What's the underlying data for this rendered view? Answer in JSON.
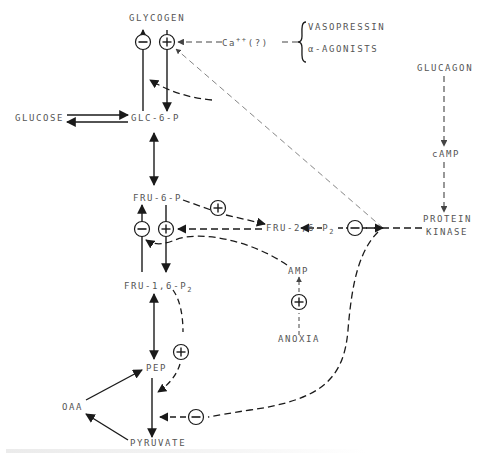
{
  "nodes": {
    "glycogen": "GLYCOGEN",
    "glucose": "GLUCOSE",
    "glc6p": "GLC-6-P",
    "fru6p": "FRU-6-P",
    "fru16p2_main": "FRU-1,6-P",
    "fru16p2_sub": "2",
    "fru26p2_main": "FRU-2,6-P",
    "fru26p2_sub": "2",
    "pep": "PEP",
    "oaa": "OAA",
    "pyruvate": "PYRUVATE",
    "amp": "AMP",
    "anoxia": "ANOXIA",
    "glucagon": "GLUCAGON",
    "camp": "cAMP",
    "protein_kinase_line1": "PROTEIN",
    "protein_kinase_line2": "KINASE",
    "calcium_main": "Ca",
    "calcium_sup": "++",
    "calcium_suffix": "(?)",
    "vasopressin": "VASOPRESSIN",
    "alpha_agonists": "α-AGONISTS"
  },
  "regulators": {
    "plus": "+",
    "minus": "−"
  },
  "colors": {
    "ink": "#1a1a1a",
    "label": "#555555",
    "light_dash": "#777777"
  }
}
